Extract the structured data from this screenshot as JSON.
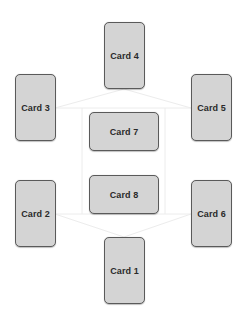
{
  "diagram": {
    "type": "card-spread-layout",
    "background_color": "#ffffff",
    "card_fill_color": "#d4d4d4",
    "card_border_color": "#5a5a5a",
    "connector_color": "#ececec",
    "cards": [
      {
        "id": "card-1",
        "label": "Card 1",
        "orientation": "portrait",
        "x": 104,
        "y": 237
      },
      {
        "id": "card-2",
        "label": "Card 2",
        "orientation": "portrait",
        "x": 15,
        "y": 180
      },
      {
        "id": "card-3",
        "label": "Card 3",
        "orientation": "portrait",
        "x": 15,
        "y": 74
      },
      {
        "id": "card-4",
        "label": "Card 4",
        "orientation": "portrait",
        "x": 104,
        "y": 22
      },
      {
        "id": "card-5",
        "label": "Card 5",
        "orientation": "portrait",
        "x": 191,
        "y": 74
      },
      {
        "id": "card-6",
        "label": "Card 6",
        "orientation": "portrait",
        "x": 191,
        "y": 180
      },
      {
        "id": "card-7",
        "label": "Card 7",
        "orientation": "landscape",
        "x": 89,
        "y": 112
      },
      {
        "id": "card-8",
        "label": "Card 8",
        "orientation": "landscape",
        "x": 89,
        "y": 175
      }
    ]
  }
}
